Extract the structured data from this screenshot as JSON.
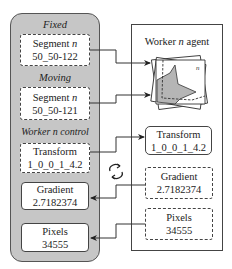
{
  "left_panel": {
    "sections": [
      {
        "label": "Fixed",
        "box": {
          "line1": "Segment",
          "italic": "n",
          "line2": "50_50-122",
          "border": "dashed"
        }
      },
      {
        "label": "Moving",
        "box": {
          "line1": "Segment",
          "italic": "n",
          "line2": "50_50-121",
          "border": "dashed"
        }
      },
      {
        "label": "Worker n control"
      }
    ],
    "control_boxes": [
      {
        "line1": "Transform",
        "line2": "1_0_0_1_4.2",
        "border": "dashed"
      },
      {
        "line1": "Gradient",
        "line2": "2.7182374",
        "border": "solid"
      },
      {
        "line1": "Pixels",
        "line2": "34555",
        "border": "solid"
      }
    ],
    "control_label_prefix": "Worker",
    "control_label_italic": "n",
    "control_label_suffix": "control"
  },
  "right_panel": {
    "title_prefix": "Worker",
    "title_italic": "n",
    "title_suffix": "agent",
    "image_label": "n",
    "boxes": [
      {
        "line1": "Transform",
        "line2": "1_0_0_1_4.2",
        "border": "solid"
      },
      {
        "line1": "Gradient",
        "line2": "2.7182374",
        "border": "dashed"
      },
      {
        "line1": "Pixels",
        "line2": "34555",
        "border": "dashed"
      }
    ]
  },
  "icons": {
    "sync": "sync-cycle-icon"
  },
  "colors": {
    "panel_fill": "#c6c6c6",
    "stroke": "#444444",
    "shape_fill": "#b5b5b5"
  }
}
